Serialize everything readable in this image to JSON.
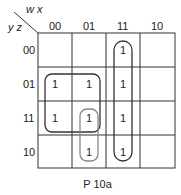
{
  "kmap": {
    "row_var_label": "y z",
    "col_var_label": "w x",
    "col_headers": [
      "00",
      "01",
      "11",
      "10"
    ],
    "row_headers": [
      "00",
      "01",
      "11",
      "10"
    ],
    "cells": [
      [
        "",
        "",
        "1",
        ""
      ],
      [
        "1",
        "1",
        "1",
        ""
      ],
      [
        "1",
        "1",
        "1",
        ""
      ],
      [
        "",
        "1",
        "1",
        ""
      ]
    ],
    "groups": [
      {
        "name": "quad-rows-01-11-cols-00-01",
        "color": "#333333"
      },
      {
        "name": "column-11-all-rows",
        "color": "#333333"
      },
      {
        "name": "pair-col-01-rows-11-10",
        "color": "#777777"
      }
    ]
  },
  "caption": "P 10a"
}
